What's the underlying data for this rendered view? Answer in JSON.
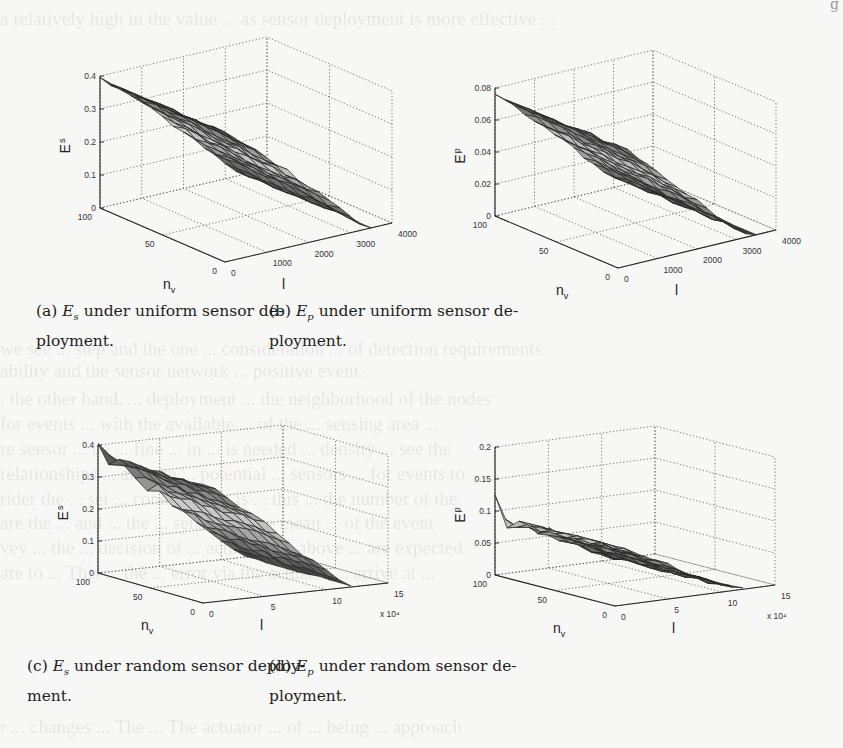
{
  "page": {
    "header_right_fragment": "g"
  },
  "figures": [
    {
      "id": "a",
      "caption_label": "(a)",
      "caption_var": "E",
      "caption_sub": "s",
      "caption_line1": " under uniform sensor de-",
      "caption_line2": "ployment.",
      "z_label": "E",
      "z_label_sub": "s",
      "x_label": "n",
      "x_label_sub": "v",
      "y_label": "l",
      "y_multiplier": "",
      "z_ticks": [
        "0",
        "0.1",
        "0.2",
        "0.3",
        "0.4"
      ],
      "x_ticks": [
        "0",
        "50",
        "100"
      ],
      "y_ticks": [
        "0",
        "1000",
        "2000",
        "3000",
        "4000"
      ]
    },
    {
      "id": "b",
      "caption_label": "(b)",
      "caption_var": "E",
      "caption_sub": "p",
      "caption_line1": " under uniform sensor de-",
      "caption_line2": "ployment.",
      "z_label": "E",
      "z_label_sub": "p",
      "x_label": "n",
      "x_label_sub": "v",
      "y_label": "l",
      "y_multiplier": "",
      "z_ticks": [
        "0",
        "0.02",
        "0.04",
        "0.06",
        "0.08"
      ],
      "x_ticks": [
        "0",
        "50",
        "100"
      ],
      "y_ticks": [
        "0",
        "1000",
        "2000",
        "3000",
        "4000"
      ]
    },
    {
      "id": "c",
      "caption_label": "(c)",
      "caption_var": "E",
      "caption_sub": "s",
      "caption_line1": " under random sensor deploy-",
      "caption_line2": "ment.",
      "z_label": "E",
      "z_label_sub": "s",
      "x_label": "n",
      "x_label_sub": "v",
      "y_label": "l",
      "y_multiplier": "x 10⁴",
      "z_ticks": [
        "0",
        "0.1",
        "0.2",
        "0.3",
        "0.4"
      ],
      "x_ticks": [
        "0",
        "50",
        "100"
      ],
      "y_ticks": [
        "0",
        "5",
        "10",
        "15"
      ]
    },
    {
      "id": "d",
      "caption_label": "(d)",
      "caption_var": "E",
      "caption_sub": "p",
      "caption_line1": " under random sensor de-",
      "caption_line2": "ployment.",
      "z_label": "E",
      "z_label_sub": "p",
      "x_label": "n",
      "x_label_sub": "v",
      "y_label": "l",
      "y_multiplier": "x 10⁴",
      "z_ticks": [
        "0",
        "0.05",
        "0.1",
        "0.15",
        "0.2"
      ],
      "x_ticks": [
        "0",
        "50",
        "100"
      ],
      "y_ticks": [
        "0",
        "5",
        "10",
        "15"
      ]
    }
  ],
  "chart_data": [
    {
      "type": "surface",
      "title": "(a) Es under uniform sensor deployment.",
      "xlabel": "n_v",
      "ylabel": "l",
      "zlabel": "E_s",
      "xlim": [
        0,
        100
      ],
      "ylim": [
        0,
        4000
      ],
      "zlim": [
        0,
        0.4
      ],
      "x": [
        0,
        10,
        20,
        30,
        40,
        50,
        60,
        70,
        80,
        90,
        100
      ],
      "y": [
        0,
        250,
        500,
        750,
        1000,
        1250,
        1500,
        1750,
        2000,
        2250,
        2500,
        2750,
        3000,
        3250,
        3500
      ],
      "description": "E_s is roughly independent of n_v and decreases almost linearly in l from ~0.39 at l=0 to ~0.0 at l~3500",
      "z_profile_vs_l": [
        0.39,
        0.37,
        0.345,
        0.32,
        0.29,
        0.26,
        0.23,
        0.2,
        0.17,
        0.14,
        0.11,
        0.08,
        0.05,
        0.02,
        0.0
      ],
      "grid": true
    },
    {
      "type": "surface",
      "title": "(b) Ep under uniform sensor deployment.",
      "xlabel": "n_v",
      "ylabel": "l",
      "zlabel": "E_p",
      "xlim": [
        0,
        100
      ],
      "ylim": [
        0,
        4000
      ],
      "zlim": [
        0,
        0.08
      ],
      "x": [
        0,
        10,
        20,
        30,
        40,
        50,
        60,
        70,
        80,
        90,
        100
      ],
      "y": [
        0,
        250,
        500,
        750,
        1000,
        1250,
        1500,
        1750,
        2000,
        2250,
        2500,
        2750,
        3000,
        3250,
        3500
      ],
      "description": "E_p decreases with l from ~0.075 at l=0 to ~0.0 at l~3500, nearly flat along n_v",
      "z_profile_vs_l": [
        0.075,
        0.072,
        0.066,
        0.06,
        0.054,
        0.048,
        0.042,
        0.036,
        0.03,
        0.024,
        0.018,
        0.012,
        0.007,
        0.003,
        0.0
      ],
      "grid": true
    },
    {
      "type": "surface",
      "title": "(c) Es under random sensor deployment.",
      "xlabel": "n_v",
      "ylabel": "l (x 10^4)",
      "zlabel": "E_s",
      "xlim": [
        0,
        100
      ],
      "ylim": [
        0,
        15
      ],
      "zlim": [
        0,
        0.4
      ],
      "x": [
        0,
        10,
        20,
        30,
        40,
        50,
        60,
        70,
        80,
        90,
        100
      ],
      "y": [
        0,
        1,
        2,
        3,
        4,
        5,
        6,
        7,
        8,
        9,
        10,
        11,
        12
      ],
      "description": "E_s decreases with l from ~0.35-0.38 to ~0.0 at l~12x10^4; jagged/noisy near low n_v (spikes up to ~0.35)",
      "z_profile_vs_l": [
        0.37,
        0.35,
        0.32,
        0.29,
        0.26,
        0.23,
        0.19,
        0.16,
        0.12,
        0.09,
        0.06,
        0.03,
        0.0
      ],
      "grid": true
    },
    {
      "type": "surface",
      "title": "(d) Ep under random sensor deployment.",
      "xlabel": "n_v",
      "ylabel": "l (x 10^4)",
      "zlabel": "E_p",
      "xlim": [
        0,
        100
      ],
      "ylim": [
        0,
        15
      ],
      "zlim": [
        0,
        0.2
      ],
      "x": [
        0,
        10,
        20,
        30,
        40,
        50,
        60,
        70,
        80,
        90,
        100
      ],
      "y": [
        0,
        1,
        2,
        3,
        4,
        5,
        6,
        7,
        8,
        9,
        10,
        11,
        12
      ],
      "description": "E_p decreases with l from ~0.09 to ~0.0 at l~12x10^4; spike ~0.12 at n_v~100,l~0 and jagged edge at low n_v",
      "z_profile_vs_l": [
        0.09,
        0.085,
        0.078,
        0.07,
        0.062,
        0.053,
        0.044,
        0.035,
        0.026,
        0.018,
        0.01,
        0.004,
        0.0
      ],
      "grid": true
    }
  ]
}
